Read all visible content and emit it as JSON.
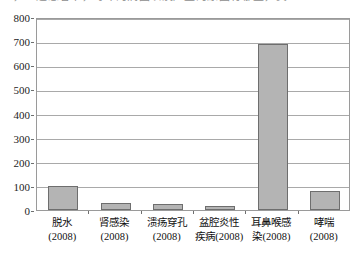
{
  "top_clipped_text": "一，上述患者中，每年的病因以及产生的原因有哪些，其",
  "chart_data": {
    "type": "bar",
    "title": "",
    "subtitle": "",
    "xlabel": "",
    "ylabel": "",
    "categories": [
      "脱水\n(2008)",
      "肾感染\n(2008)",
      "溃疡穿孔\n(2008)",
      "盆腔炎性\n疾病(2008)",
      "耳鼻喉感\n染(2008)",
      "哮喘\n(2008)"
    ],
    "category_lines": [
      [
        "脱水",
        "(2008)"
      ],
      [
        "肾感染",
        "(2008)"
      ],
      [
        "溃疡穿孔",
        "(2008)"
      ],
      [
        "盆腔炎性",
        "疾病(2008)"
      ],
      [
        "耳鼻喉感",
        "染(2008)"
      ],
      [
        "哮喘",
        "(2008)"
      ]
    ],
    "values": [
      100,
      28,
      27,
      15,
      688,
      78
    ],
    "ylim": [
      0,
      800
    ],
    "ytick_values": [
      0,
      100,
      200,
      300,
      400,
      500,
      600,
      700,
      800
    ],
    "ytick_labels": [
      "0",
      "100",
      "200",
      "300",
      "400",
      "500",
      "600",
      "700",
      "800"
    ],
    "grid": true,
    "grid_axis": "y",
    "legend": false,
    "legend_position": "none",
    "bar_fill_color": "#b4b4b4",
    "bar_border_color": "#6e6e6e",
    "gridline_color": "#a9a9a9",
    "frame_color": "#9a9a9a",
    "plot_background": "#ffffff"
  }
}
